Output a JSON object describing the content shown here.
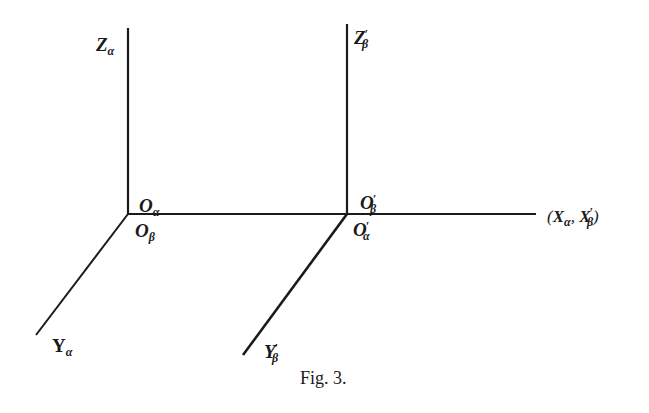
{
  "figure": {
    "caption": "Fig. 3."
  },
  "axes": {
    "frame_alpha": {
      "z_label": {
        "base": "Z",
        "sub": "α",
        "prime": ""
      },
      "y_label": {
        "base": "Y",
        "sub": "α",
        "prime": ""
      },
      "origin_top": {
        "base": "O",
        "sub": "α",
        "prime": ""
      },
      "origin_bottom": {
        "base": "O",
        "sub": "β",
        "prime": ""
      }
    },
    "frame_beta": {
      "z_label": {
        "base": "Z",
        "sub": "β",
        "prime": "′"
      },
      "y_label": {
        "base": "Y",
        "sub": "β",
        "prime": "′"
      },
      "origin_top": {
        "base": "O",
        "sub": "β",
        "prime": "′"
      },
      "origin_bottom": {
        "base": "O",
        "sub": "α",
        "prime": "′"
      }
    },
    "shared_x_label": {
      "open": "(",
      "first": {
        "base": "X",
        "sub": "α"
      },
      "sep": ", ",
      "second": {
        "base": "X",
        "sub": "β",
        "prime": "′"
      },
      "close": ")"
    }
  },
  "colors": {
    "line": "#1a1a1a",
    "background": "#ffffff"
  }
}
